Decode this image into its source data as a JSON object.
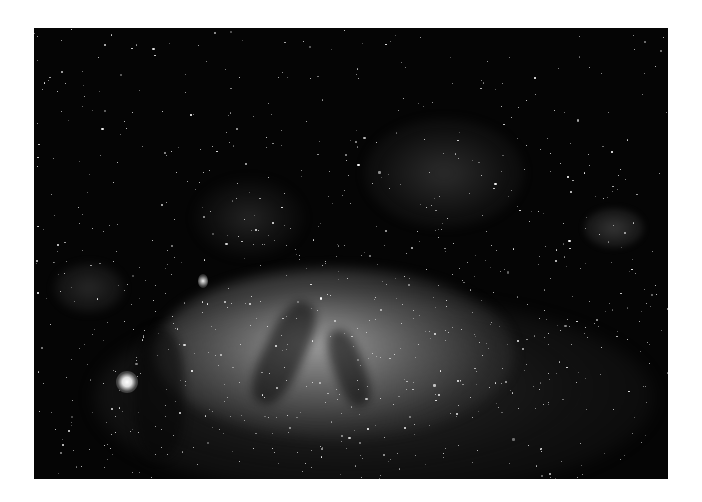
{
  "image": {
    "subject": "Milky Way galactic center star field",
    "style": "grayscale astrophotograph",
    "background_color": "#ffffff",
    "photo_frame": {
      "left": 34,
      "top": 28,
      "width": 634,
      "height": 451
    },
    "palette": {
      "sky": "#050505",
      "core_glow": "#c8c8c8",
      "stars": "#ffffff"
    }
  }
}
